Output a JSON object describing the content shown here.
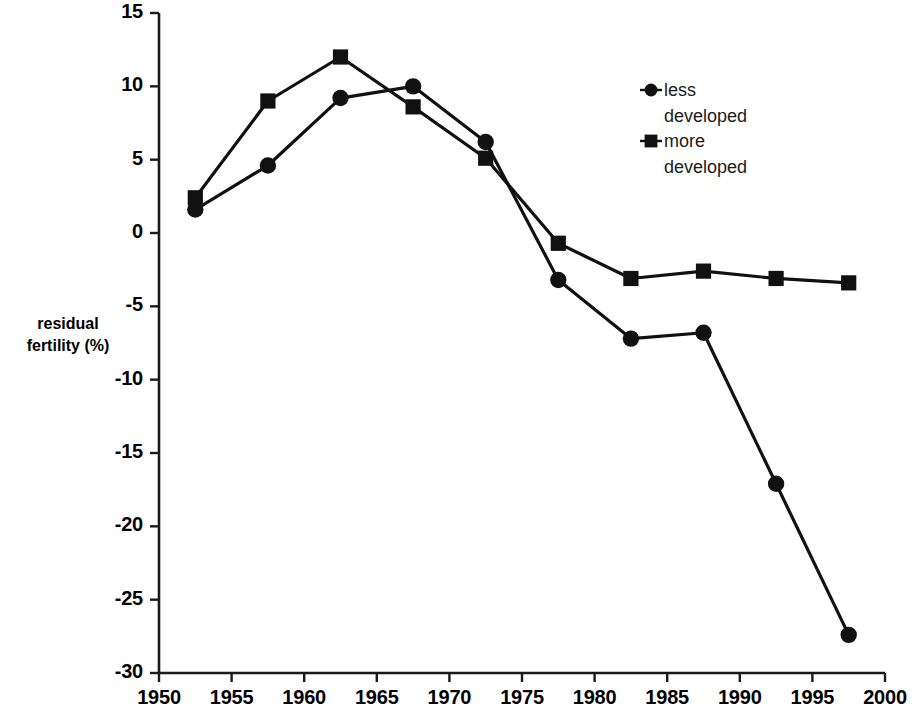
{
  "chart_data": {
    "type": "line",
    "title": "",
    "xlabel": "",
    "ylabel": "residual fertility (%)",
    "ylabel_line1": "residual",
    "ylabel_line2": "fertility (%)",
    "xlim": [
      1950,
      2000
    ],
    "ylim": [
      -30,
      15
    ],
    "x_ticks": [
      1950,
      1955,
      1960,
      1965,
      1970,
      1975,
      1980,
      1985,
      1990,
      1995,
      2000
    ],
    "y_ticks": [
      15,
      10,
      5,
      0,
      -5,
      -10,
      -15,
      -20,
      -25,
      -30
    ],
    "x_tick_labels": [
      "1950",
      "1955",
      "1960",
      "1965",
      "1970",
      "1975",
      "1980",
      "1985",
      "1990",
      "1995",
      "2000"
    ],
    "y_tick_labels": [
      "15",
      "10",
      "5",
      "0",
      "-5",
      "-10",
      "-15",
      "-20",
      "-25",
      "-30"
    ],
    "grid": false,
    "legend_position": "upper right",
    "x": [
      1952.5,
      1957.5,
      1962.5,
      1967.5,
      1972.5,
      1977.5,
      1982.5,
      1987.5,
      1992.5,
      1997.5
    ],
    "series": [
      {
        "name": "less developed",
        "name_line1": "less",
        "name_line2": "developed",
        "marker": "circle",
        "color": "#111111",
        "values": [
          1.6,
          4.6,
          9.2,
          10.0,
          6.2,
          -3.2,
          -7.2,
          -6.8,
          -17.1,
          -27.4
        ]
      },
      {
        "name": "more developed",
        "name_line1": "more",
        "name_line2": "developed",
        "marker": "square",
        "color": "#111111",
        "values": [
          2.4,
          9.0,
          12.0,
          8.6,
          5.1,
          -0.7,
          -3.1,
          -2.6,
          -3.1,
          -3.4
        ]
      }
    ]
  },
  "axes": {
    "y_title_line1": "residual",
    "y_title_line2": "fertility (%)"
  }
}
